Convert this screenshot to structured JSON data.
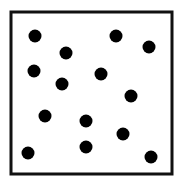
{
  "figure": {
    "frame": {
      "x": 11,
      "y": 12,
      "width": 161,
      "height": 162,
      "stroke": "#111111",
      "stroke_width": 3
    },
    "dot_color": "#000000",
    "dot_radius": 6.5,
    "dot_count": 14,
    "dots": [
      {
        "x": 35,
        "y": 36
      },
      {
        "x": 116,
        "y": 36
      },
      {
        "x": 149,
        "y": 47
      },
      {
        "x": 66,
        "y": 53
      },
      {
        "x": 34,
        "y": 71
      },
      {
        "x": 101,
        "y": 74
      },
      {
        "x": 62,
        "y": 84
      },
      {
        "x": 131,
        "y": 96
      },
      {
        "x": 45,
        "y": 116
      },
      {
        "x": 86,
        "y": 121
      },
      {
        "x": 123,
        "y": 134
      },
      {
        "x": 86,
        "y": 147
      },
      {
        "x": 28,
        "y": 153
      },
      {
        "x": 151,
        "y": 157
      }
    ]
  }
}
